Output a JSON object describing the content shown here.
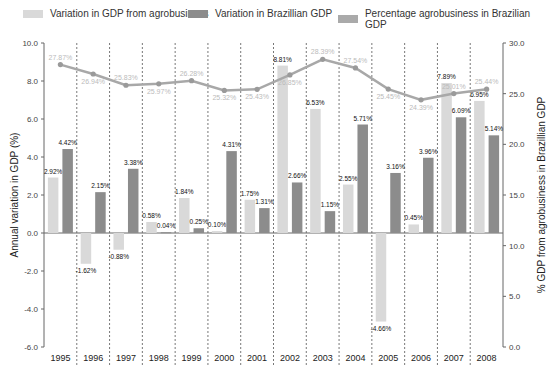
{
  "chart_data": {
    "type": "bar",
    "title": "",
    "xlabel": "",
    "ylabel": "Annual variation in GDP (%)",
    "ylabel_right": "% GDP from agrobusiness in Brazillian GDP",
    "ylim": [
      -6.0,
      10.0
    ],
    "ylim_right": [
      0.0,
      30.0
    ],
    "yticks": [
      "10.0",
      "8.0",
      "6.0",
      "4.0",
      "2.0",
      "0.0",
      "-2.0",
      "-4.0",
      "-6.0"
    ],
    "yticks_right": [
      "30.0",
      "25.0",
      "20.0",
      "15.0",
      "10.0",
      "5.0",
      "0.0"
    ],
    "grid": "vertical dashed separators between years",
    "legend_position": "top",
    "categories": [
      "1995",
      "1996",
      "1997",
      "1998",
      "1999",
      "2000",
      "2001",
      "2002",
      "2003",
      "2004",
      "2005",
      "2006",
      "2007",
      "2008"
    ],
    "series": [
      {
        "name": "Variation in GDP from agrobusiness",
        "type": "bar",
        "axis": "left",
        "color": "#d6d6d6",
        "values": [
          2.92,
          -1.62,
          -0.88,
          0.58,
          1.84,
          0.1,
          1.75,
          8.81,
          6.53,
          2.55,
          -4.66,
          0.45,
          7.89,
          6.95
        ],
        "labels": [
          "2.92%",
          "-1.62%",
          "-0.88%",
          "0.58%",
          "1.84%",
          "0.10%",
          "1.75%",
          "8.81%",
          "6.53%",
          "2.55%",
          "-4.66%",
          "0.45%",
          "7.89%",
          "6.95%"
        ]
      },
      {
        "name": "Variation in Brazillian GDP",
        "type": "bar",
        "axis": "left",
        "color": "#8c8c8c",
        "values": [
          4.42,
          2.15,
          3.38,
          0.04,
          0.25,
          4.31,
          1.31,
          2.66,
          1.15,
          5.71,
          3.16,
          3.96,
          6.09,
          5.14
        ],
        "labels": [
          "4.42%",
          "2.15%",
          "3.38%",
          "0.04%",
          "0.25%",
          "4.31%",
          "1.31%",
          "2.66%",
          "1.15%",
          "5.71%",
          "3.16%",
          "3.96%",
          "6.09%",
          "5.14%"
        ]
      },
      {
        "name": "Percentage agrobusiness in Brazilian GDP",
        "type": "line",
        "axis": "right",
        "color": "#a8a8a8",
        "values": [
          27.87,
          26.94,
          25.83,
          25.97,
          26.28,
          25.32,
          25.43,
          26.85,
          28.39,
          27.54,
          25.45,
          24.39,
          25.01,
          25.44
        ],
        "labels": [
          "27.87%",
          "26.94%",
          "25.83%",
          "25.97%",
          "26.28%",
          "25.32%",
          "25.43%",
          "26.85%",
          "28.39%",
          "27.54%",
          "25.45%",
          "24.39%",
          "25.01%",
          "25.44%"
        ]
      }
    ]
  },
  "legend": {
    "items": [
      {
        "label": "Variation in GDP from agrobusiness",
        "color": "#d6d6d6"
      },
      {
        "label": "Variation in Brazillian GDP",
        "color": "#8c8c8c"
      },
      {
        "label": "Percentage agrobusiness in Brazilian GDP",
        "color": "#a8a8a8"
      }
    ]
  }
}
